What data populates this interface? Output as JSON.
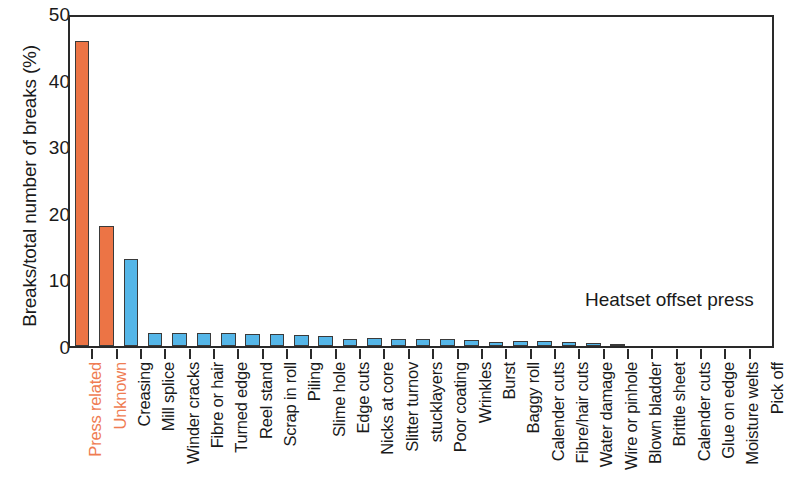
{
  "chart_data": {
    "type": "bar",
    "title": "",
    "subtitle": "",
    "xlabel": "",
    "ylabel": "Breaks/total number of breaks (%)",
    "ylim": [
      0,
      50
    ],
    "yticks": [
      0,
      10,
      20,
      30,
      40,
      50
    ],
    "grid": false,
    "legend": "none",
    "annotations": [
      {
        "text": "Heatset offset press",
        "x": 0.66,
        "y": 0.82
      }
    ],
    "categories": [
      "Press related",
      "Unknown",
      "Creasing",
      "Mill splice",
      "Winder cracks",
      "Fibre or hair",
      "Turned edge",
      "Reel stand",
      "Scrap in roll",
      "Piling",
      "Slime hole",
      "Edge cuts",
      "Nicks at core",
      "Slitter turnov",
      "stucklayers",
      "Poor coating",
      "Wrinkles",
      "Burst",
      "Baggy roll",
      "Calender cuts",
      "Fibre/hair cuts",
      "Water damage",
      "Wire or pinhole",
      "Blown bladder",
      "Brittle sheet",
      "Calender cuts",
      "Glue on edge",
      "Moisture welts",
      "Pick off"
    ],
    "values": [
      45.8,
      18.0,
      13.0,
      1.9,
      1.9,
      1.9,
      1.9,
      1.8,
      1.8,
      1.6,
      1.5,
      1.1,
      1.2,
      1.1,
      1.0,
      1.0,
      0.9,
      0.6,
      0.7,
      0.7,
      0.6,
      0.5,
      0.35,
      0.0,
      0.0,
      0.0,
      0.0,
      0.0,
      0.0
    ],
    "colors": [
      "#ec7445",
      "#ec7445",
      "#55b6e8",
      "#55b6e8",
      "#55b6e8",
      "#55b6e8",
      "#55b6e8",
      "#55b6e8",
      "#55b6e8",
      "#55b6e8",
      "#55b6e8",
      "#55b6e8",
      "#55b6e8",
      "#55b6e8",
      "#55b6e8",
      "#55b6e8",
      "#55b6e8",
      "#55b6e8",
      "#55b6e8",
      "#55b6e8",
      "#55b6e8",
      "#55b6e8",
      "#55b6e8",
      "#55b6e8",
      "#55b6e8",
      "#55b6e8",
      "#55b6e8",
      "#55b6e8",
      "#55b6e8"
    ],
    "label_colors": [
      "#ef7c52",
      "#ef7c52",
      "#1a1a1a",
      "#1a1a1a",
      "#1a1a1a",
      "#1a1a1a",
      "#1a1a1a",
      "#1a1a1a",
      "#1a1a1a",
      "#1a1a1a",
      "#1a1a1a",
      "#1a1a1a",
      "#1a1a1a",
      "#1a1a1a",
      "#1a1a1a",
      "#1a1a1a",
      "#1a1a1a",
      "#1a1a1a",
      "#1a1a1a",
      "#1a1a1a",
      "#1a1a1a",
      "#1a1a1a",
      "#1a1a1a",
      "#1a1a1a",
      "#1a1a1a",
      "#1a1a1a",
      "#1a1a1a",
      "#1a1a1a",
      "#1a1a1a"
    ],
    "accent_color": "#ef7c52",
    "bar_color_primary": "#ec7445",
    "bar_color_secondary": "#55b6e8",
    "axis_color": "#2a2a2a"
  }
}
